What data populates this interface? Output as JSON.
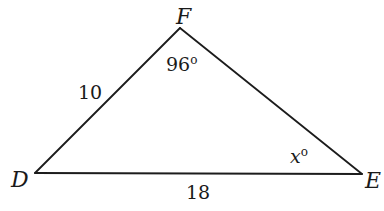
{
  "figure": {
    "type": "triangle",
    "vertices": {
      "D": {
        "label": "D",
        "x": 35,
        "y": 173
      },
      "E": {
        "label": "E",
        "x": 362,
        "y": 174
      },
      "F": {
        "label": "F",
        "x": 180,
        "y": 28
      }
    },
    "sides": {
      "DF": {
        "label": "10"
      },
      "DE": {
        "label": "18"
      }
    },
    "angles": {
      "F": {
        "value": "96",
        "degree_symbol": "o"
      },
      "E": {
        "variable": "x",
        "degree_symbol": "o"
      }
    },
    "colors": {
      "stroke": "#1c1c1c",
      "text": "#1a1a1a",
      "background": "#ffffff"
    }
  }
}
